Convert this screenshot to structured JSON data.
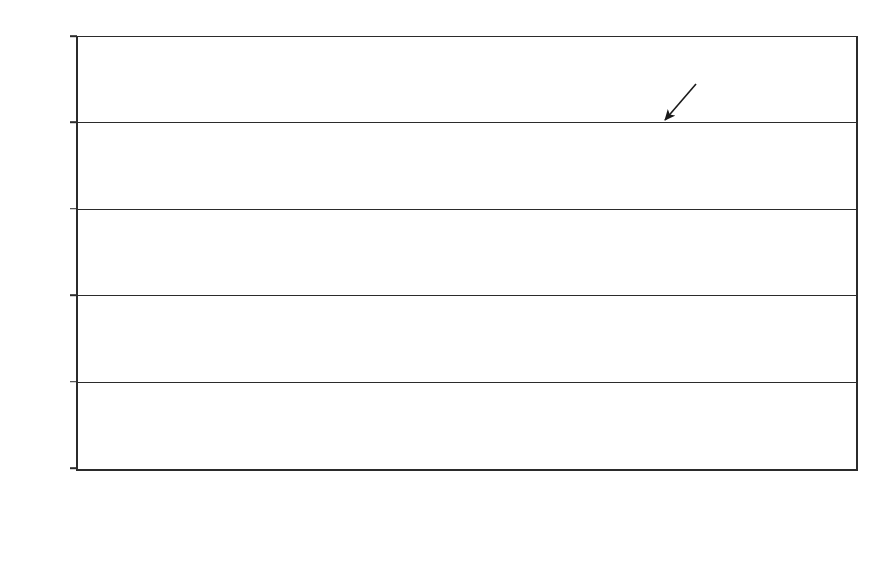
{
  "chart_data": {
    "type": "bar",
    "title": "",
    "subtitle": "",
    "xlabel": "",
    "ylabel": "",
    "stacked": true,
    "grid": true,
    "legend_position": "bottom",
    "ylim": [
      0,
      1000
    ],
    "yticks": [
      0,
      200,
      400,
      600,
      800,
      1000
    ],
    "ytick_labels": [
      "0",
      "200",
      "400",
      "600",
      "800",
      "1,000"
    ],
    "categories": [
      {
        "line1": "1689–1707",
        "line2": "(D)"
      },
      {
        "line1": "1707–1727",
        "line2": "(D)"
      },
      {
        "line1": "1727–1745",
        "line2": "(D)"
      },
      {
        "line1": "1745–1763",
        "line2": "(D)"
      },
      {
        "line1": "1763–1782",
        "line2": "(D)"
      },
      {
        "line1": "1782–1800",
        "line2": "(D)"
      },
      {
        "line1": "1801–1816",
        "line2": "inflated"
      },
      {
        "line1": "1817–1829",
        "line2": "inflated"
      }
    ],
    "series": [
      {
        "name": "pre-union Wmr",
        "key": "pre",
        "color": "#b8b8b8",
        "pattern": "solid-grey",
        "values": [
          12,
          0,
          0,
          0,
          8,
          0,
          0,
          0
        ]
      },
      {
        "name": "other domestic",
        "key": "other",
        "color": "#ffffff",
        "pattern": "diagonal-hatch",
        "values": [
          68,
          106,
          92,
          88,
          188,
          430,
          196,
          288
        ]
      },
      {
        "name": "military-fiscal",
        "key": "mil",
        "color": "#0d0d0d",
        "pattern": "solid-black",
        "values": [
          20,
          46,
          28,
          32,
          92,
          353,
          392,
          134
        ]
      },
      {
        "name": "local",
        "key": "local",
        "color": "#ffffff",
        "pattern": "solid-white",
        "values": [
          5,
          9,
          57,
          44,
          40,
          117,
          122,
          108
        ]
      }
    ],
    "cumulative_tops": {
      "pre": [
        12,
        0,
        0,
        0,
        8,
        0,
        0,
        0
      ],
      "other": [
        80,
        106,
        92,
        88,
        196,
        430,
        196,
        288
      ],
      "mil": [
        100,
        152,
        120,
        120,
        288,
        783,
        588,
        422
      ],
      "total": [
        105,
        161,
        177,
        164,
        328,
        900,
        710,
        530
      ]
    },
    "annotations": [
      {
        "name": "union",
        "text": "union",
        "points_to_category": "1801–1816",
        "points_to_value": 710
      }
    ],
    "legend": [
      {
        "label": "local",
        "swatch": "white-square"
      },
      {
        "label": "military-fiscal",
        "swatch": "black-square"
      },
      {
        "label": "other domestic",
        "swatch": "hatched-square"
      },
      {
        "label": "pre-union Wmr",
        "swatch": "grey-square"
      }
    ]
  }
}
